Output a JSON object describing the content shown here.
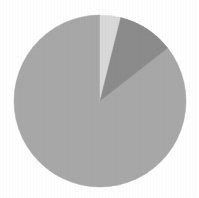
{
  "chart_data": {
    "type": "pie",
    "title": "",
    "subtitle": "",
    "xlabel": "",
    "ylabel": "",
    "grid": false,
    "legend": false,
    "legend_position": "none",
    "start_angle_deg": 0,
    "direction": "clockwise",
    "center_x": 100,
    "center_y": 101,
    "radius": 86,
    "background_color": "#ffffff",
    "categories": [
      "Slice 1",
      "Slice 2",
      "Slice 3"
    ],
    "values": [
      85.5,
      4.0,
      10.5
    ],
    "units": "percent",
    "slices": [
      {
        "label": "Slice 1",
        "value": 85.5,
        "color": "#a8a8a8",
        "start_angle_deg": 52,
        "end_angle_deg": 360
      },
      {
        "label": "Slice 2",
        "value": 4.0,
        "color": "#d9d9d9",
        "start_angle_deg": 0,
        "end_angle_deg": 14
      },
      {
        "label": "Slice 3",
        "value": 10.5,
        "color": "#8c8c8c",
        "start_angle_deg": 14,
        "end_angle_deg": 52
      }
    ],
    "annotations": []
  }
}
